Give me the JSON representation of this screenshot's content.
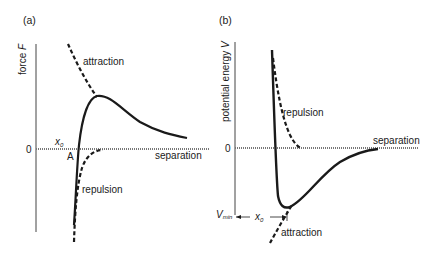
{
  "panels": {
    "a": {
      "label": "(a)",
      "y_axis_label": "force",
      "y_axis_symbol": "F",
      "zero_label": "0",
      "x_axis_label": "separation",
      "point_label": "A",
      "x0_label": "x",
      "x0_sub": "0",
      "curve_labels": {
        "attraction": "attraction",
        "repulsion": "repulsion"
      }
    },
    "b": {
      "label": "(b)",
      "y_axis_label": "potential energy",
      "y_axis_symbol": "V",
      "zero_label": "0",
      "x_axis_label": "separation",
      "vmin_label": "V",
      "vmin_sub": "min",
      "x0_label": "x",
      "x0_sub": "0",
      "curve_labels": {
        "attraction": "attraction",
        "repulsion": "repulsion"
      }
    }
  },
  "colors": {
    "ink": "#1a1a1a",
    "axis": "#444444",
    "zero_line": "#777777",
    "background": "#ffffff"
  }
}
